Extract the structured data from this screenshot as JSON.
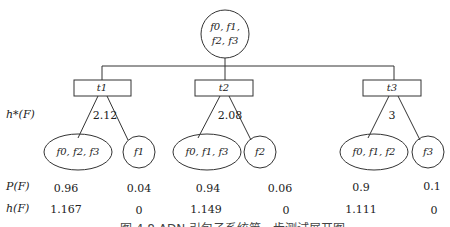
{
  "root": {
    "line1": "f0, f1,",
    "line2": "f2, f3"
  },
  "tests": [
    {
      "label": "t1",
      "h_star": "2.12",
      "left_leaf": "f0, f2, f3",
      "right_leaf": "f1",
      "P_left": "0.96",
      "P_right": "0.04",
      "h_left": "1.167",
      "h_right": "0"
    },
    {
      "label": "t2",
      "h_star": "2.08",
      "left_leaf": "f0, f1, f3",
      "right_leaf": "f2",
      "P_left": "0.94",
      "P_right": "0.06",
      "h_left": "1.149",
      "h_right": "0"
    },
    {
      "label": "t3",
      "h_star": "3",
      "left_leaf": "f0, f1, f2",
      "right_leaf": "f3",
      "P_left": "0.9",
      "P_right": "0.1",
      "h_left": "1.111",
      "h_right": "0"
    }
  ],
  "row_labels": {
    "h_star": "h*(F)",
    "P": "P(F)",
    "h": "h(F)"
  },
  "caption": "图 4.8  ADN 引包子系统第一步测试展开图"
}
